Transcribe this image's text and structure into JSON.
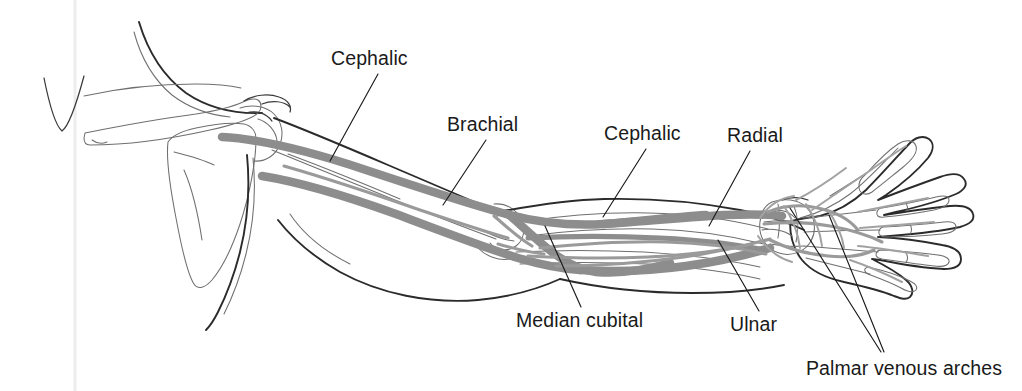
{
  "figure": {
    "view": "anterior view of right upper limb with superficial and deep veins",
    "background_color": "#ffffff",
    "vein_color": "#8d8d8d",
    "bone_color": "#2b2b2b",
    "leader_color": "#1a1a1a",
    "text_color": "#1a1a1a"
  },
  "labels": [
    {
      "id": "cephalic-upper",
      "text": "Cephalic",
      "text_x": 331,
      "text_y": 65,
      "leader": "M 378 74 L 330 161",
      "structure": "cephalic vein (upper arm segment)"
    },
    {
      "id": "brachial",
      "text": "Brachial",
      "text_x": 447,
      "text_y": 131,
      "leader": "M 486 140 L 443 205",
      "structure": "brachial vein"
    },
    {
      "id": "cephalic-forearm",
      "text": "Cephalic",
      "text_x": 604,
      "text_y": 140,
      "leader": "M 646 149 L 603 217",
      "structure": "cephalic vein (forearm segment)"
    },
    {
      "id": "radial",
      "text": "Radial",
      "text_x": 727,
      "text_y": 142,
      "leader": "M 750 151 L 709 226",
      "structure": "radial vein"
    },
    {
      "id": "median-cubital",
      "text": "Median cubital",
      "text_x": 516,
      "text_y": 327,
      "leader": "M 545 226 L 581 307",
      "structure": "median cubital vein"
    },
    {
      "id": "ulnar",
      "text": "Ulnar",
      "text_x": 730,
      "text_y": 331,
      "leader": "M 718 240 L 759 311",
      "structure": "ulnar vein"
    },
    {
      "id": "palmar-venous-arches",
      "text": "Palmar venous arches",
      "text_x": 806,
      "text_y": 375,
      "leaders": [
        "M 790 208 L 881 352",
        "M 829 215 L 884 352"
      ],
      "structure": "superficial and deep palmar venous arches"
    }
  ],
  "anatomy": {
    "regions": [
      "sternum",
      "ribs",
      "clavicle",
      "scapula",
      "humerus",
      "radius",
      "ulna",
      "carpals",
      "metacarpals",
      "phalanges"
    ],
    "veins": [
      "cephalic",
      "brachial",
      "basilic",
      "median cubital",
      "radial",
      "ulnar",
      "palmar venous arches",
      "digital veins"
    ]
  }
}
